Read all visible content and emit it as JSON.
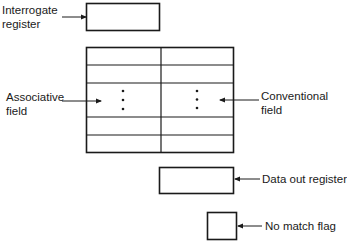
{
  "diagram": {
    "type": "associative-memory-organization",
    "labels": {
      "interrogate_register": [
        "Interrogate",
        "register"
      ],
      "associative_field": [
        "Associative",
        "field"
      ],
      "conventional_field": [
        "Conventional",
        "field"
      ],
      "data_out_register": "Data out register",
      "no_match_flag": "No match flag"
    },
    "ellipsis": "⋮",
    "colors": {
      "line": "#1a1a1a",
      "background": "#ffffff"
    }
  }
}
